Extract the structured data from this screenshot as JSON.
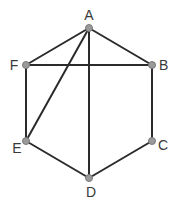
{
  "diagram": {
    "type": "graph",
    "nodes": [
      {
        "id": "A",
        "label": "A",
        "x": 89,
        "y": 28,
        "lx": 89,
        "ly": 20,
        "anchor": "middle"
      },
      {
        "id": "B",
        "label": "B",
        "x": 152,
        "y": 65,
        "lx": 159,
        "ly": 70,
        "anchor": "start"
      },
      {
        "id": "C",
        "label": "C",
        "x": 152,
        "y": 141,
        "lx": 158,
        "ly": 150,
        "anchor": "start"
      },
      {
        "id": "D",
        "label": "D",
        "x": 89,
        "y": 178,
        "lx": 91,
        "ly": 197,
        "anchor": "middle"
      },
      {
        "id": "E",
        "label": "E",
        "x": 26,
        "y": 141,
        "lx": 17,
        "ly": 153,
        "anchor": "middle"
      },
      {
        "id": "F",
        "label": "F",
        "x": 26,
        "y": 65,
        "lx": 14,
        "ly": 70,
        "anchor": "middle"
      }
    ],
    "edges": [
      {
        "from": "A",
        "to": "F"
      },
      {
        "from": "A",
        "to": "B"
      },
      {
        "from": "A",
        "to": "E"
      },
      {
        "from": "A",
        "to": "D"
      },
      {
        "from": "F",
        "to": "B"
      },
      {
        "from": "F",
        "to": "E"
      },
      {
        "from": "B",
        "to": "C"
      },
      {
        "from": "E",
        "to": "D"
      },
      {
        "from": "D",
        "to": "C"
      }
    ]
  }
}
